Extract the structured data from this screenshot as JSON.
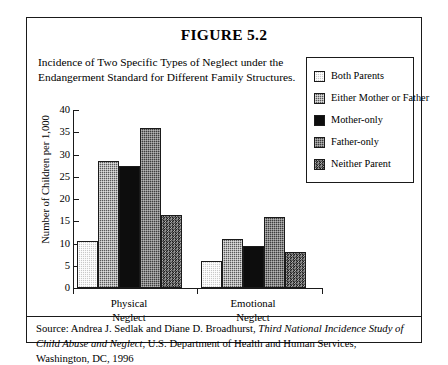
{
  "figure": {
    "title": "FIGURE 5.2",
    "subtitle": "Incidence of Two Specific Types of Neglect under the Endangerment Standard for Different Family Structures.",
    "source_prefix": "Source: Andrea J. Sedlak and Diane D. Broadhurst, ",
    "source_italic_1": "Third National Incidence Study of Child Abuse and Neglect",
    "source_suffix": ", U.S. Department of Health and Human Services, Washington, DC, 1996"
  },
  "chart_data": {
    "type": "bar",
    "title": "Incidence of Two Specific Types of Neglect under the Endangerment Standard for Different Family Structures.",
    "xlabel": "",
    "ylabel": "Number of Children per 1,000",
    "ylim": [
      0,
      40
    ],
    "yticks": [
      0,
      5,
      10,
      15,
      20,
      25,
      30,
      35,
      40
    ],
    "grid": false,
    "legend_position": "right",
    "categories": [
      "Physical Neglect",
      "Emotional Neglect"
    ],
    "category_lines": [
      [
        "Physical",
        "Neglect"
      ],
      [
        "Emotional",
        "Neglect"
      ]
    ],
    "series": [
      {
        "name": "Both Parents",
        "pattern": "light-dotted",
        "color": "#c9c9c9",
        "values": [
          10.5,
          6.0
        ]
      },
      {
        "name": "Either Mother or Father",
        "pattern": "medium-checker",
        "color": "#585858",
        "values": [
          28.5,
          11.0
        ]
      },
      {
        "name": "Mother-only",
        "pattern": "solid-black",
        "color": "#0d0d0d",
        "values": [
          27.5,
          9.5
        ]
      },
      {
        "name": "Father-only",
        "pattern": "dark-checker",
        "color": "#3d3d3d",
        "values": [
          36.0,
          16.0
        ]
      },
      {
        "name": "Neither Parent",
        "pattern": "dark-noise",
        "color": "#1f1f1f",
        "values": [
          16.5,
          8.0
        ]
      }
    ]
  }
}
